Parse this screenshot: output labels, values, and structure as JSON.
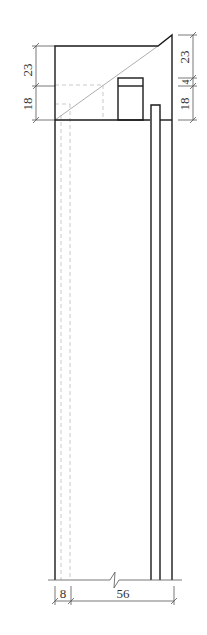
{
  "drawing": {
    "type": "architectural-section",
    "colors": {
      "outline": "#1a1a1a",
      "dashed": "#bbbbbb",
      "dimension": "#555555",
      "text": "#333333"
    }
  },
  "dimensions": {
    "left": {
      "upper": "23",
      "lower": "18"
    },
    "right": {
      "upper": "23",
      "middle": "4",
      "lower": "18"
    },
    "bottom": {
      "left": "8",
      "right": "56"
    }
  }
}
